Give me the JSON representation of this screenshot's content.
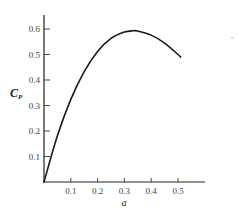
{
  "chart_data": {
    "type": "line",
    "title": "",
    "xlabel": "a",
    "ylabel": "C_P",
    "ylabel_main": "C",
    "ylabel_sub": "P",
    "xlim": [
      0,
      0.55
    ],
    "ylim": [
      0,
      0.65
    ],
    "grid": false,
    "legend": null,
    "x_ticks": [
      "0.1",
      "0.2",
      "0.3",
      "0.4",
      "0.5"
    ],
    "y_ticks": [
      "0.1",
      "0.2",
      "0.3",
      "0.4",
      "0.5",
      "0.6"
    ],
    "series": [
      {
        "name": "Cp vs a",
        "x": [
          0,
          0.05,
          0.1,
          0.15,
          0.2,
          0.25,
          0.3,
          0.333,
          0.35,
          0.4,
          0.45,
          0.5,
          0.51
        ],
        "y": [
          0,
          0.181,
          0.324,
          0.433,
          0.512,
          0.563,
          0.588,
          0.593,
          0.592,
          0.576,
          0.545,
          0.5,
          0.49
        ]
      }
    ]
  },
  "annotations": {
    "corner_mark": "\""
  }
}
